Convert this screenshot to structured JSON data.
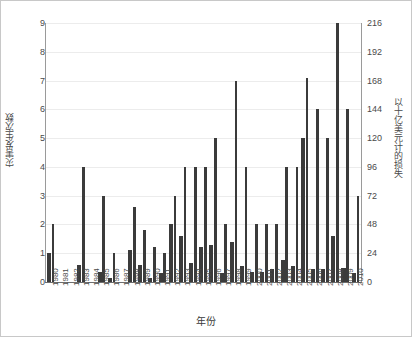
{
  "chart_data": {
    "type": "bar",
    "title": "",
    "xlabel": "年份",
    "ylabel": "灾害发生次数",
    "y2label": "以十亿美元计的损失",
    "grid": true,
    "legend": "none",
    "ylim": [
      0,
      9
    ],
    "y2lim": [
      0,
      216
    ],
    "yticks": [
      "0",
      "1",
      "2",
      "3",
      "4",
      "5",
      "6",
      "7",
      "8",
      "9"
    ],
    "y2ticks": [
      "0",
      "24",
      "48",
      "72",
      "96",
      "120",
      "144",
      "168",
      "192",
      "216"
    ],
    "categories": [
      "1980",
      "1981",
      "1982",
      "1983",
      "1984",
      "1985",
      "1986",
      "1987",
      "1988",
      "1989",
      "1990",
      "1991",
      "1992",
      "1993",
      "1994",
      "1995",
      "1996",
      "1997",
      "1998",
      "1999",
      "2000",
      "2001",
      "2002",
      "2003",
      "2004",
      "2005",
      "2006",
      "2007",
      "2008",
      "2009",
      "2010"
    ],
    "series": [
      {
        "name": "灾害发生次数",
        "axis": "left",
        "values": [
          1,
          0,
          0,
          0.6,
          0,
          0.35,
          0.15,
          0,
          1.1,
          0.6,
          0.15,
          0.3,
          2,
          1.6,
          0.65,
          1.2,
          1.3,
          0.3,
          1.4,
          0.55,
          0.35,
          0.35,
          0.45,
          0.75,
          0.55,
          5,
          0.45,
          0.45,
          1.6,
          0.5,
          0.3
        ]
      },
      {
        "name": "以十亿美元计的损失",
        "axis": "right",
        "values": [
          2,
          0,
          0,
          4,
          0,
          3,
          1,
          0,
          2.6,
          1.8,
          1.2,
          1,
          3,
          4,
          4,
          4,
          5,
          2,
          7,
          4,
          2,
          2,
          2,
          4,
          4,
          7.1,
          6,
          5,
          9,
          6,
          3
        ]
      }
    ]
  }
}
